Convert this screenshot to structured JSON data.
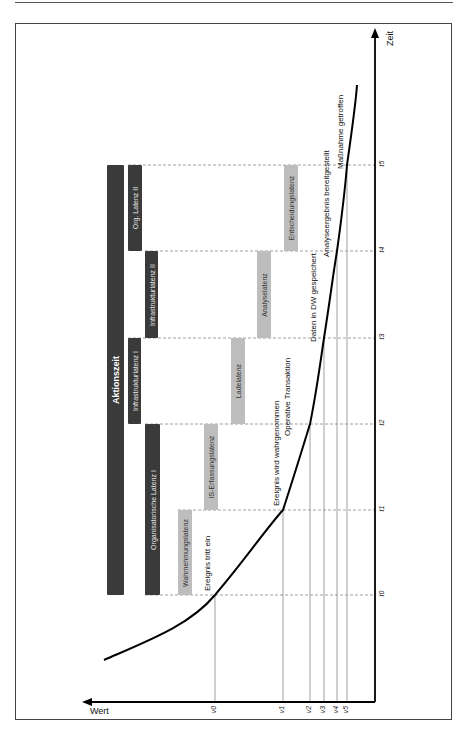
{
  "diagram": {
    "axes": {
      "time_label": "Zeit",
      "value_label": "Wert"
    },
    "time_ticks": [
      {
        "label": "t0",
        "y": 595
      },
      {
        "label": "t1",
        "y": 510
      },
      {
        "label": "t2",
        "y": 424
      },
      {
        "label": "t3",
        "y": 338
      },
      {
        "label": "t4",
        "y": 251
      },
      {
        "label": "t5",
        "y": 165
      }
    ],
    "value_ticks": [
      {
        "label": "v0",
        "x": 215
      },
      {
        "label": "v1",
        "x": 283
      },
      {
        "label": "v2",
        "x": 310
      },
      {
        "label": "v3",
        "x": 324
      },
      {
        "label": "v4",
        "x": 337
      },
      {
        "label": "v5",
        "x": 347
      }
    ],
    "main_bar": {
      "label": "Aktionszeit"
    },
    "latency_groups": [
      {
        "label": "Organisatorische Latenz I"
      },
      {
        "label": "Infrastrukturlatenz I"
      },
      {
        "label": "Infrastrukturlatenz II"
      },
      {
        "label": "Org. Latenz II"
      }
    ],
    "latencies": [
      {
        "label": "Wahrnehmungslatenz"
      },
      {
        "label": "IS-Erfassungslatenz"
      },
      {
        "label": "Ladelatenz"
      },
      {
        "label": "Analyselatenz"
      },
      {
        "label": "Entscheidungslatenz"
      }
    ],
    "events": [
      {
        "label": "Ereignis tritt ein"
      },
      {
        "label": "Ereignis wird wahrgenommen"
      },
      {
        "label": "Operative Transaktion"
      },
      {
        "label": "Daten in DW gespeichert"
      },
      {
        "label": "Analyseergebnis bereitgestellt"
      },
      {
        "label": "Maßnahme getroffen"
      }
    ],
    "colors": {
      "dark_bar": "#3a3a3a",
      "gray_bar": "#bdbdbd",
      "grid": "#888888",
      "curve": "#000000"
    }
  }
}
